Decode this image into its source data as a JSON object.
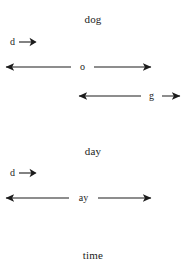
{
  "figure": {
    "background_color": "#ffffff",
    "ink_color": "#1c1c1c",
    "words": [
      {
        "id": "dog",
        "title": "dog",
        "segments": [
          {
            "id": "dog-d",
            "label": "d",
            "kind": "short-right-arrow"
          },
          {
            "id": "dog-o",
            "label": "o",
            "kind": "double-arrow"
          },
          {
            "id": "dog-g",
            "label": "g",
            "kind": "double-arrow"
          }
        ]
      },
      {
        "id": "day",
        "title": "day",
        "segments": [
          {
            "id": "day-d",
            "label": "d",
            "kind": "short-right-arrow"
          },
          {
            "id": "day-ay",
            "label": "ay",
            "kind": "double-arrow"
          }
        ]
      },
      {
        "id": "time",
        "title": "time",
        "segments": []
      }
    ]
  },
  "labels": {
    "title_dog": "dog",
    "title_day": "day",
    "title_time": "time",
    "dog_d": "d",
    "dog_o": "o",
    "dog_g": "g",
    "day_d": "d",
    "day_ay": "ay"
  }
}
